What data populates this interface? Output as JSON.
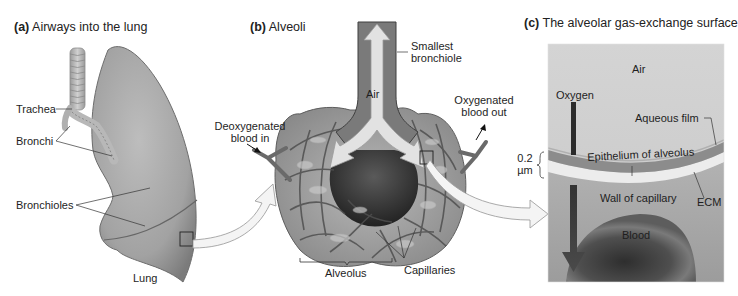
{
  "panels": {
    "a": {
      "letter": "(a)",
      "title": "Airways into the lung",
      "labels": {
        "trachea": "Trachea",
        "bronchi": "Bronchi",
        "bronchioles": "Bronchioles",
        "lung": "Lung"
      }
    },
    "b": {
      "letter": "(b)",
      "title": "Alveoli",
      "labels": {
        "smallest_bronchiole_1": "Smallest",
        "smallest_bronchiole_2": "bronchiole",
        "air": "Air",
        "deoxy_1": "Deoxygenated",
        "deoxy_2": "blood in",
        "oxy_1": "Oxygenated",
        "oxy_2": "blood out",
        "alveolus": "Alveolus",
        "capillaries": "Capillaries"
      }
    },
    "c": {
      "letter": "(c)",
      "title": "The alveolar gas-exchange surface",
      "labels": {
        "air": "Air",
        "oxygen": "Oxygen",
        "aqueous_film": "Aqueous film",
        "thickness_value": "0.2",
        "thickness_unit": "µm",
        "epithelium": "Epithelium of alveolus",
        "wall_of_capillary": "Wall of capillary",
        "ecm": "ECM",
        "blood": "Blood"
      }
    }
  },
  "colors": {
    "background": "#ffffff",
    "lung_fill": "#a8a8a8",
    "panel_c_air": "#cfcfcf",
    "epithelium_band": "#8a8a8a",
    "ecm_band": "#e8e8e8",
    "capillary_region": "#a3a3a3",
    "blood_cell": "#4a4a4a",
    "arrow_dark": "#2a2a2a"
  }
}
